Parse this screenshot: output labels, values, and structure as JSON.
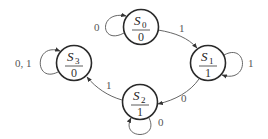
{
  "diagram": {
    "type": "moore_state_machine",
    "states": [
      {
        "id": "S0",
        "name": "S",
        "sub": "0",
        "output": "0",
        "cx": 141,
        "cy": 27
      },
      {
        "id": "S1",
        "name": "S",
        "sub": "1",
        "output": "1",
        "cx": 208,
        "cy": 63
      },
      {
        "id": "S2",
        "name": "S",
        "sub": "2",
        "output": "1",
        "cx": 140,
        "cy": 102
      },
      {
        "id": "S3",
        "name": "S",
        "sub": "3",
        "output": "0",
        "cx": 74,
        "cy": 63
      }
    ],
    "transitions": [
      {
        "from": "S0",
        "to": "S0",
        "label": "0"
      },
      {
        "from": "S0",
        "to": "S1",
        "label": "1"
      },
      {
        "from": "S1",
        "to": "S1",
        "label": "1"
      },
      {
        "from": "S1",
        "to": "S2",
        "label": "0"
      },
      {
        "from": "S2",
        "to": "S2",
        "label": "0"
      },
      {
        "from": "S2",
        "to": "S3",
        "label": "1"
      },
      {
        "from": "S3",
        "to": "S3",
        "label": "0, 1"
      }
    ]
  },
  "colors": {
    "state_stroke": "#2a2a2a",
    "edge_stroke": "#555555",
    "background": "#ffffff"
  }
}
